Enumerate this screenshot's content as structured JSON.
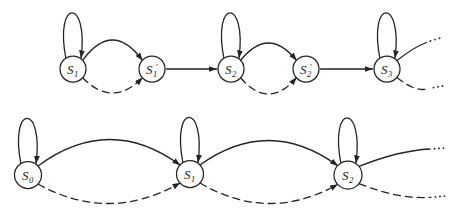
{
  "colors": {
    "ink": "#232323",
    "background": "#ffffff"
  },
  "diagram": {
    "canvas": {
      "width": 467,
      "height": 220
    },
    "rows": [
      {
        "name": "expanded-chain",
        "states": [
          "S1",
          "S1'",
          "S2",
          "S2'",
          "S3"
        ]
      },
      {
        "name": "lumped-chain",
        "states": [
          "S0",
          "S1",
          "S2"
        ]
      }
    ],
    "nodes": [
      {
        "id": "a1",
        "base": "S",
        "sub": "1",
        "prime": "",
        "cx": 73,
        "cy": 69,
        "r": 13
      },
      {
        "id": "a1p",
        "base": "S",
        "sub": "1",
        "prime": "′",
        "cx": 152,
        "cy": 69,
        "r": 13
      },
      {
        "id": "a2",
        "base": "S",
        "sub": "2",
        "prime": "",
        "cx": 231,
        "cy": 69,
        "r": 13
      },
      {
        "id": "a2p",
        "base": "S",
        "sub": "2",
        "prime": "′",
        "cx": 306,
        "cy": 69,
        "r": 13
      },
      {
        "id": "a3",
        "base": "S",
        "sub": "3",
        "prime": "",
        "cx": 387,
        "cy": 69,
        "r": 13
      },
      {
        "id": "b0",
        "base": "S",
        "sub": "0",
        "prime": "",
        "cx": 28,
        "cy": 175,
        "r": 13.5
      },
      {
        "id": "b1",
        "base": "S",
        "sub": "1",
        "prime": "",
        "cx": 190,
        "cy": 174,
        "r": 13.5
      },
      {
        "id": "b2",
        "base": "S",
        "sub": "2",
        "prime": "",
        "cx": 348,
        "cy": 175,
        "r": 14
      }
    ],
    "edges": [
      {
        "type": "loop",
        "node": "a1",
        "style": "solid"
      },
      {
        "type": "arc",
        "from": "a1",
        "to": "a1p",
        "style": "solid",
        "peak": -29
      },
      {
        "type": "arc",
        "from": "a1",
        "to": "a1p",
        "style": "dashed",
        "peak": 24
      },
      {
        "type": "line",
        "from": "a1p",
        "to": "a2",
        "style": "solid"
      },
      {
        "type": "loop",
        "node": "a2",
        "style": "solid"
      },
      {
        "type": "arc",
        "from": "a2",
        "to": "a2p",
        "style": "solid",
        "peak": -26
      },
      {
        "type": "arc",
        "from": "a2",
        "to": "a2p",
        "style": "dashed",
        "peak": 25
      },
      {
        "type": "line",
        "from": "a2p",
        "to": "a3",
        "style": "solid"
      },
      {
        "type": "loop",
        "node": "a3",
        "style": "solid"
      },
      {
        "type": "exit",
        "node": "a3",
        "style": "solid",
        "start": [
          397,
          60.6
        ],
        "ctrl": [
          414,
          47
        ],
        "end": [
          426.5,
          42.5
        ],
        "dots": [
          [
            430.5,
            41
          ],
          [
            435,
            39.6
          ],
          [
            439.5,
            38.2
          ]
        ]
      },
      {
        "type": "exit",
        "node": "a3",
        "style": "dashed",
        "start": [
          397,
          77.4
        ],
        "ctrl": [
          416,
          93
        ],
        "end": [
          429,
          88.5
        ],
        "dots": [
          [
            433.5,
            87.6
          ],
          [
            438,
            86.8
          ],
          [
            442.5,
            86
          ]
        ]
      },
      {
        "type": "loop",
        "node": "b0",
        "style": "solid"
      },
      {
        "type": "arc",
        "from": "b0",
        "to": "b1",
        "style": "solid",
        "peak": -35
      },
      {
        "type": "arc",
        "from": "b0",
        "to": "b1",
        "style": "dashed",
        "peak": 29
      },
      {
        "type": "loop",
        "node": "b1",
        "style": "solid"
      },
      {
        "type": "arc",
        "from": "b1",
        "to": "b2",
        "style": "solid",
        "peak": -34
      },
      {
        "type": "arc",
        "from": "b1",
        "to": "b2",
        "style": "dashed",
        "peak": 29
      },
      {
        "type": "loop",
        "node": "b2",
        "style": "solid"
      },
      {
        "type": "exit",
        "node": "b2",
        "style": "solid",
        "start": [
          359,
          166.4
        ],
        "ctrl": [
          399,
          150.5
        ],
        "end": [
          430,
          149
        ],
        "dots": [
          [
            434.5,
            148.7
          ],
          [
            439,
            148.4
          ],
          [
            443.5,
            148.1
          ]
        ]
      },
      {
        "type": "exit",
        "node": "b2",
        "style": "dashed",
        "start": [
          359,
          183.6
        ],
        "ctrl": [
          399,
          199.5
        ],
        "end": [
          431,
          197.3
        ],
        "dots": [
          [
            435.5,
            196.9
          ],
          [
            440,
            196.5
          ],
          [
            444.5,
            196.1
          ]
        ]
      }
    ]
  }
}
